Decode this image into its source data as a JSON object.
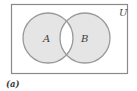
{
  "figure": {
    "type": "venn-diagram",
    "universe_label": "U",
    "set_a_label": "A",
    "set_b_label": "B",
    "caption": "(a)",
    "shading": "sets A and B shaded, intersection unshaded (symmetric difference)",
    "colors": {
      "background": "#ffffff",
      "shade_fill": "#e5e5e5",
      "circle_outline": "#9a9a9a",
      "rectangle_outline": "#8a8a8a",
      "text": "#3c3c3c"
    }
  }
}
